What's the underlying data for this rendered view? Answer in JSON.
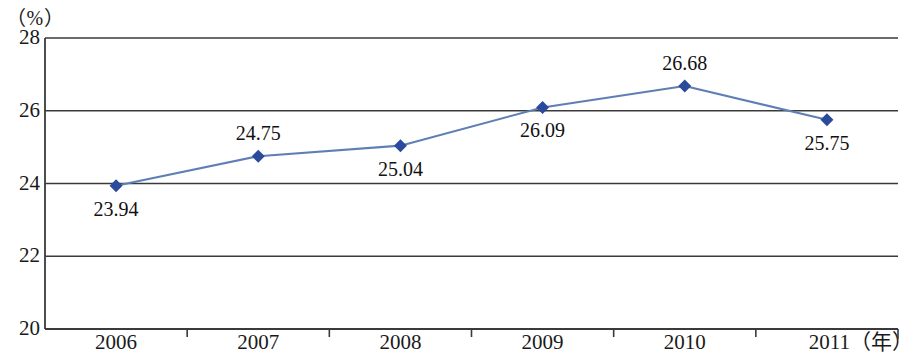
{
  "chart_data": {
    "type": "line",
    "title": "",
    "subtitle": "",
    "xlabel": "年",
    "ylabel": "",
    "y_unit_caption": "（%）",
    "x_axis_suffix_label": "（年）",
    "categories": [
      "2006",
      "2007",
      "2008",
      "2009",
      "2010",
      "2011"
    ],
    "series": [
      {
        "name": "",
        "values": [
          23.94,
          24.75,
          25.04,
          26.09,
          26.68,
          25.75
        ],
        "line_color": "#5f7fb4",
        "marker_color": "#2a4a9c",
        "marker_shape": "diamond"
      }
    ],
    "point_labels": [
      "23.94",
      "24.75",
      "25.04",
      "26.09",
      "26.68",
      "25.75"
    ],
    "point_label_positions": [
      "below",
      "above",
      "below",
      "below",
      "above",
      "below"
    ],
    "ylim": [
      20,
      28
    ],
    "yticks": [
      "20",
      "22",
      "24",
      "26",
      "28"
    ],
    "ytick_values": [
      20,
      22,
      24,
      26,
      28
    ],
    "grid": true,
    "grid_axis": "y",
    "legend": false,
    "legend_position": "none",
    "axis_color": "#3a3a3a",
    "background_color": "#ffffff"
  },
  "axis": {
    "y_unit": "（%）",
    "x_last_suffix": "（年）"
  }
}
